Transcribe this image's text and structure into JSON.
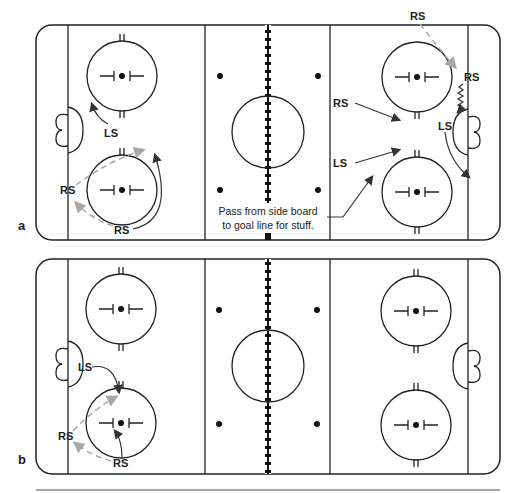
{
  "figure": {
    "panels": [
      {
        "id": "a",
        "label": "a",
        "players": [
          {
            "label": "LS",
            "role": "left-side skater",
            "x": 112,
            "y": 133
          },
          {
            "label": "RS",
            "role": "right-side skater",
            "x": 68,
            "y": 190
          },
          {
            "label": "RS",
            "role": "right-side skater",
            "x": 122,
            "y": 230
          },
          {
            "label": "RS",
            "role": "right-side skater",
            "x": 415,
            "y": 16
          },
          {
            "label": "RS",
            "role": "right-side skater",
            "x": 470,
            "y": 77
          },
          {
            "label": "RS",
            "role": "right-side skater",
            "x": 343,
            "y": 103
          },
          {
            "label": "LS",
            "role": "left-side skater",
            "x": 450,
            "y": 126
          },
          {
            "label": "LS",
            "role": "left-side skater",
            "x": 343,
            "y": 163
          }
        ],
        "annotation": {
          "line1": "Pass from side board",
          "line2": "to goal line for stuff."
        }
      },
      {
        "id": "b",
        "label": "b",
        "players": [
          {
            "label": "LS",
            "role": "left-side skater",
            "x": 86,
            "y": 368
          },
          {
            "label": "RS",
            "role": "right-side skater",
            "x": 65,
            "y": 436
          },
          {
            "label": "RS",
            "role": "right-side skater",
            "x": 122,
            "y": 463
          }
        ]
      }
    ],
    "legend": {
      "solid_arrow": "skater movement",
      "dashed_gray_arrow": "pass",
      "wavy_arrow": "skating with puck"
    }
  }
}
